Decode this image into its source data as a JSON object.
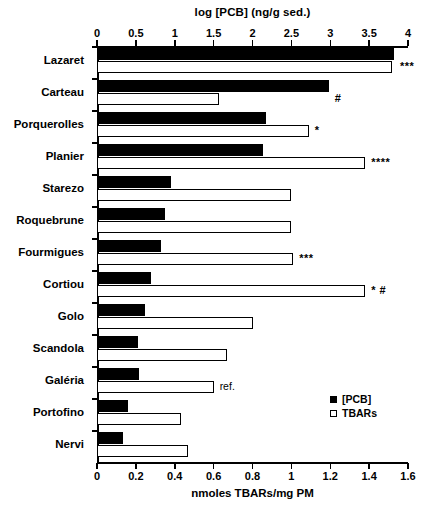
{
  "chart_data": {
    "type": "bar",
    "orientation": "horizontal",
    "title": "",
    "top_axis": {
      "label": "log [PCB] (ng/g sed.)",
      "ticks": [
        0,
        0.5,
        1,
        1.5,
        2,
        2.5,
        3,
        3.5,
        4
      ],
      "tick_labels": [
        "0",
        "0.5",
        "1",
        "1.5",
        "2",
        "2.5",
        "3",
        "3.5",
        "4"
      ],
      "range": [
        0,
        4
      ]
    },
    "bottom_axis": {
      "label": "nmoles TBARs/mg PM",
      "ticks": [
        0,
        0.2,
        0.4,
        0.6,
        0.8,
        1,
        1.2,
        1.4,
        1.6
      ],
      "tick_labels": [
        "0",
        "0.2",
        "0.4",
        "0.6",
        "0.8",
        "1",
        "1.2",
        "1.4",
        "1.6"
      ],
      "range": [
        0,
        1.6
      ]
    },
    "categories": [
      "Lazaret",
      "Carteau",
      "Porquerolles",
      "Planier",
      "Starezo",
      "Roquebrune",
      "Fourmigues",
      "Cortiou",
      "Golo",
      "Scandola",
      "Galéria",
      "Portofino",
      "Nervi"
    ],
    "series": [
      {
        "name": "[PCB]",
        "axis": "top",
        "style": "filled",
        "units": "log ng/g sed.",
        "values": [
          3.82,
          2.98,
          2.17,
          2.14,
          0.95,
          0.88,
          0.82,
          0.7,
          0.62,
          0.53,
          0.54,
          0.4,
          0.34
        ]
      },
      {
        "name": "TBARs",
        "axis": "bottom",
        "style": "open",
        "units": "nmoles TBARs/mg PM",
        "values": [
          1.52,
          0.63,
          1.09,
          1.38,
          1.0,
          1.0,
          1.01,
          1.38,
          0.8,
          0.67,
          0.6,
          0.43,
          0.47
        ]
      }
    ],
    "annotations": [
      {
        "category": "Lazaret",
        "text": "***"
      },
      {
        "category": "Carteau",
        "text": "#"
      },
      {
        "category": "Porquerolles",
        "text": "*"
      },
      {
        "category": "Planier",
        "text": "****"
      },
      {
        "category": "Starezo",
        "text": ""
      },
      {
        "category": "Roquebrune",
        "text": ""
      },
      {
        "category": "Fourmigues",
        "text": "***"
      },
      {
        "category": "Cortiou",
        "text": "* #"
      },
      {
        "category": "Golo",
        "text": ""
      },
      {
        "category": "Scandola",
        "text": ""
      },
      {
        "category": "Galéria",
        "text": "ref."
      },
      {
        "category": "Portofino",
        "text": ""
      },
      {
        "category": "Nervi",
        "text": ""
      }
    ],
    "legend": {
      "position": "bottom-right",
      "entries": [
        {
          "label": "[PCB]",
          "marker": "filled-square"
        },
        {
          "label": "TBARs",
          "marker": "open-square"
        }
      ]
    },
    "grid": false,
    "colors": {
      "pcb": "#000000",
      "tbars_fill": "#ffffff",
      "tbars_stroke": "#000000",
      "axis": "#000000"
    }
  }
}
